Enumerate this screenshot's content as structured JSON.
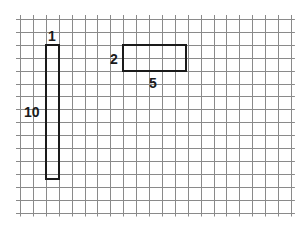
{
  "diagram": {
    "type": "grid-rectangles",
    "grid": {
      "columns": 21,
      "rows": 15,
      "line_color": "#8a8a8a",
      "background": "#ffffff"
    },
    "shapes": [
      {
        "name": "tall-rectangle",
        "width_units": 1,
        "height_units": 10,
        "width_label": "1",
        "height_label": "10",
        "stroke": "#1a1a1a"
      },
      {
        "name": "wide-rectangle",
        "width_units": 5,
        "height_units": 2,
        "width_label": "5",
        "height_label": "2",
        "stroke": "#1a1a1a"
      }
    ]
  }
}
